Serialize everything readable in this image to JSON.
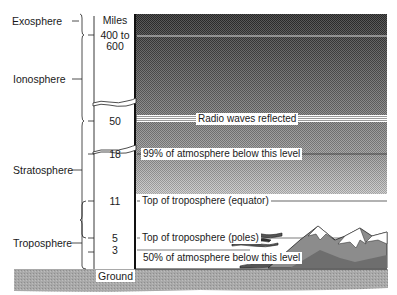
{
  "scale": {
    "unit_label": "Miles",
    "ground_label": "Ground",
    "altitudes": [
      {
        "id": "exosphere-base",
        "label": "400 to\n600"
      },
      {
        "id": "radio",
        "label": "50"
      },
      {
        "id": "ninety-nine",
        "label": "18"
      },
      {
        "id": "trop-equator",
        "label": "11"
      },
      {
        "id": "trop-poles",
        "label": "5"
      },
      {
        "id": "fifty",
        "label": "3"
      }
    ]
  },
  "layers": [
    {
      "id": "exosphere",
      "label": "Exosphere"
    },
    {
      "id": "ionosphere",
      "label": "Ionosphere"
    },
    {
      "id": "stratosphere",
      "label": "Stratosphere"
    },
    {
      "id": "troposphere",
      "label": "Troposphere"
    }
  ],
  "levels": [
    {
      "id": "radio",
      "label": "Radio waves reflected"
    },
    {
      "id": "ninety-nine",
      "label": "99% of atmosphere below this level"
    },
    {
      "id": "trop-equator",
      "label": "Top of troposphere (equator)"
    },
    {
      "id": "trop-poles",
      "label": "Top of troposphere (poles)"
    },
    {
      "id": "fifty",
      "label": "50% of atmosphere below this level"
    }
  ],
  "colors": {
    "sky_dark": "#4a4a4a",
    "sky_mid": "#8a8a8a",
    "sky_light": "#c4c4c4",
    "ground": "#a8a8a8",
    "line": "#1a1a1a"
  }
}
